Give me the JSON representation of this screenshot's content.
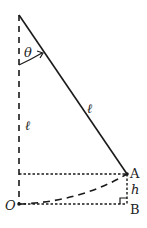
{
  "diagram": {
    "type": "pendulum",
    "labels": {
      "theta": "θ",
      "string_length": "ℓ",
      "vertical_length": "ℓ",
      "point_a": "A",
      "point_b": "B",
      "origin": "O",
      "height": "h"
    },
    "colors": {
      "line": "#1a1a1a",
      "background": "#ffffff"
    }
  }
}
